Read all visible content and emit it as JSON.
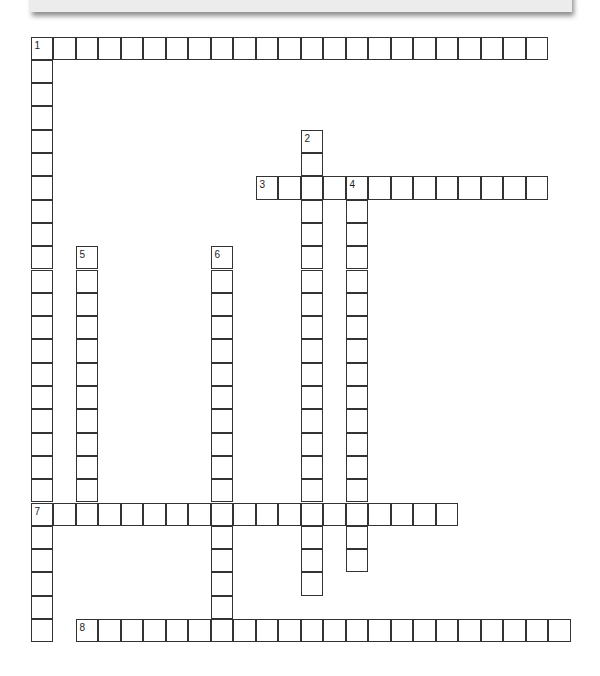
{
  "puzzle": {
    "type": "crossword",
    "grid_origin": {
      "x": 31,
      "y": 37
    },
    "cell_width": 22.5,
    "cell_height": 23.3,
    "colors": {
      "border": "#333333",
      "banner": "#ececec",
      "background": "#ffffff"
    },
    "entries": [
      {
        "number": "1",
        "direction": "across",
        "row": 0,
        "col": 0,
        "length": 23
      },
      {
        "number": "1",
        "direction": "down",
        "row": 0,
        "col": 0,
        "length": 26
      },
      {
        "number": "2",
        "direction": "down",
        "row": 4,
        "col": 12,
        "length": 20
      },
      {
        "number": "3",
        "direction": "across",
        "row": 6,
        "col": 10,
        "length": 13
      },
      {
        "number": "4",
        "direction": "down",
        "row": 6,
        "col": 14,
        "length": 17
      },
      {
        "number": "5",
        "direction": "down",
        "row": 9,
        "col": 2,
        "length": 12
      },
      {
        "number": "6",
        "direction": "down",
        "row": 9,
        "col": 8,
        "length": 17
      },
      {
        "number": "7",
        "direction": "across",
        "row": 20,
        "col": 0,
        "length": 19
      },
      {
        "number": "8",
        "direction": "across",
        "row": 25,
        "col": 2,
        "length": 22
      }
    ]
  }
}
